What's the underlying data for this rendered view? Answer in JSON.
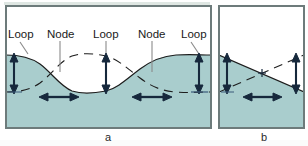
{
  "figure": {
    "background_color": "#ffffff",
    "water_fill_color": "#a9cdcd",
    "water_line_color": "#1d1d1d",
    "frame_color": "#6d7b7b",
    "arrow_color": "#16283c",
    "leader_color": "#8a8a8a",
    "label_color": "#1a1a1a"
  },
  "panels": [
    {
      "id": "a",
      "caption": "a",
      "mode": "two-node sinusoidal standing wave",
      "labels": [
        {
          "text": "Loop",
          "name": "label-loop-left",
          "x": 8,
          "y": 38,
          "leader": "diagonal-down-right"
        },
        {
          "text": "Node",
          "name": "label-node-left",
          "x": 47,
          "y": 38,
          "leader": "vertical"
        },
        {
          "text": "Loop",
          "name": "label-loop-center",
          "x": 93,
          "y": 38,
          "leader": "vertical"
        },
        {
          "text": "Node",
          "name": "label-node-right",
          "x": 138,
          "y": 38,
          "leader": "vertical"
        },
        {
          "text": "Loop",
          "name": "label-loop-right",
          "x": 181,
          "y": 38,
          "leader": "diagonal-down-left"
        }
      ],
      "vertical_arrows": [
        {
          "name": "amplitude-arrow-left",
          "x": 14,
          "top": 55,
          "bottom": 92
        },
        {
          "name": "amplitude-arrow-center",
          "x": 106,
          "top": 55,
          "bottom": 92
        },
        {
          "name": "amplitude-arrow-right",
          "x": 199,
          "top": 55,
          "bottom": 92
        }
      ],
      "horizontal_arrows": [
        {
          "name": "flow-arrow-left",
          "x1": 40,
          "x2": 78,
          "y": 97
        },
        {
          "name": "flow-arrow-right",
          "x1": 133,
          "x2": 171,
          "y": 97
        }
      ]
    },
    {
      "id": "b",
      "caption": "b",
      "mode": "single-node linear standing wave",
      "labels": [],
      "vertical_arrows": [
        {
          "name": "amplitude-arrow-left",
          "x": 227,
          "top": 55,
          "bottom": 92
        },
        {
          "name": "amplitude-arrow-right",
          "x": 296,
          "top": 55,
          "bottom": 92
        }
      ],
      "horizontal_arrows": [
        {
          "name": "flow-arrow-center",
          "x1": 243,
          "x2": 281,
          "y": 97
        }
      ],
      "node_marker": {
        "name": "node-cross-marker",
        "x": 262,
        "y": 73
      }
    }
  ]
}
